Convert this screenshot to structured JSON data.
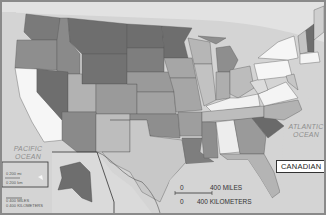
{
  "map": {
    "title": "",
    "labels": {
      "pacific": "PACIFIC OCEAN",
      "pacific_line1": "PACIFIC",
      "pacific_line2": "OCEAN",
      "atlantic_line1": "ATLANTIC",
      "atlantic_line2": "OCEAN"
    },
    "legend": {
      "label": "CANADIAN"
    },
    "scale": {
      "zero_miles": "0",
      "miles": "400 MILES",
      "zero_km": "0",
      "km": "400 KILOMETERS"
    },
    "alaska_scale": {
      "zero_miles": "0",
      "miles": "400 MILES",
      "zero_km": "0",
      "km": "400 KILOMETERS"
    },
    "hawaii_scale": {
      "zero_miles": "0",
      "miles": "200 mi",
      "zero_km": "0",
      "km": "200 km"
    },
    "colors": {
      "water": "#d4d4d4",
      "dark": "#6e6e6e",
      "medium_dark": "#8a8a8a",
      "medium": "#a6a6a6",
      "light": "#bdbdbd",
      "white": "#f6f6f6",
      "canada": "#e2e2e2"
    }
  }
}
